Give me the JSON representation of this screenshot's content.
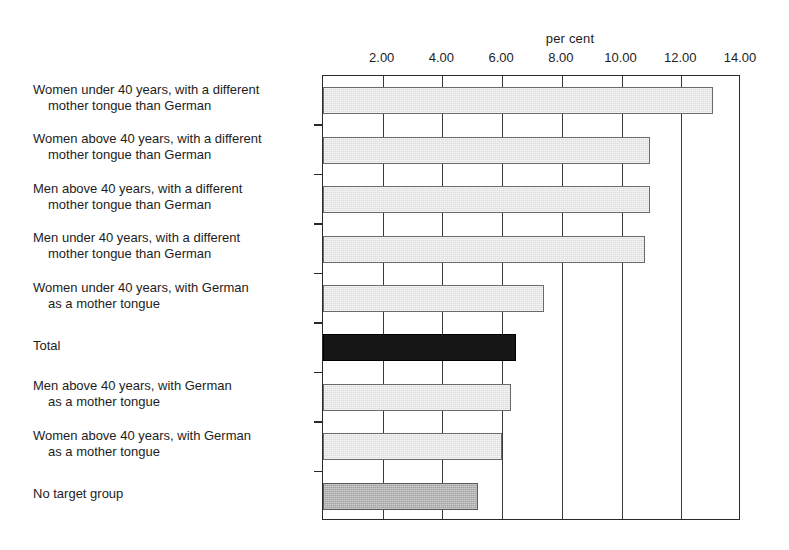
{
  "chart_data": {
    "type": "bar",
    "orientation": "horizontal",
    "title": "",
    "xlabel": "per cent",
    "ylabel": "",
    "xlim": [
      0,
      14
    ],
    "xticks": [
      2.0,
      4.0,
      6.0,
      8.0,
      10.0,
      12.0,
      14.0
    ],
    "xtick_labels": [
      "2.00",
      "4.00",
      "6.00",
      "8.00",
      "10.00",
      "12.00",
      "14.00"
    ],
    "grid": true,
    "legend": "none",
    "categories": [
      "Women  under 40 years, with a different mother tongue than German",
      "Women above 40 years, with a different mother tongue than German",
      "Men above 40 years, with a different mother tongue than German",
      "Men under 40 years, with a different mother tongue than German",
      "Women under 40 years, with German as a mother tongue",
      "Total",
      "Men above 40 years, with German as a mother tongue",
      "Women above 40 years, with German as a mother tongue",
      "No target group"
    ],
    "category_lines": [
      [
        "Women  under 40 years, with a different",
        "mother tongue than German"
      ],
      [
        "Women above 40 years, with a different",
        "mother tongue than German"
      ],
      [
        "Men above 40 years, with a different",
        "mother tongue than German"
      ],
      [
        "Men under 40 years, with a different",
        "mother tongue than German"
      ],
      [
        "Women under 40 years, with German",
        "as a mother tongue"
      ],
      [
        "Total",
        ""
      ],
      [
        "Men above 40 years, with German",
        "as a mother tongue"
      ],
      [
        "Women above 40 years, with German",
        "as a mother tongue"
      ],
      [
        "No target group",
        ""
      ]
    ],
    "values": [
      13.05,
      10.95,
      10.95,
      10.8,
      7.4,
      6.45,
      6.3,
      6.0,
      5.2
    ],
    "bar_styles": [
      "light",
      "light",
      "light",
      "light",
      "light",
      "dark",
      "light",
      "light",
      "mid"
    ],
    "colors": {
      "light": "#dcdcdc",
      "mid": "#a3a3a3",
      "dark": "#161616",
      "axis": "#2a2a2a",
      "text": "#1d1d1d",
      "background": "#ffffff"
    }
  }
}
